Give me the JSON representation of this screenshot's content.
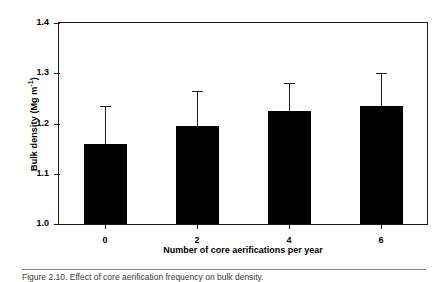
{
  "chart_data": {
    "type": "bar",
    "title": "",
    "categories": [
      "0",
      "2",
      "4",
      "6"
    ],
    "values": [
      1.16,
      1.195,
      1.225,
      1.235
    ],
    "errors": [
      0.075,
      0.07,
      0.055,
      0.065
    ],
    "series": [
      {
        "name": "Bulk density",
        "values": [
          1.16,
          1.195,
          1.225,
          1.235
        ],
        "errors": [
          0.075,
          0.07,
          0.055,
          0.065
        ]
      }
    ],
    "xlabel": "Number of core aerifications per year",
    "ylabel_text": "Bulk density (Mg m",
    "ylabel_sup": "-1",
    "ylabel_tail": ")",
    "ylabel_full": "Bulk density (Mg m-1)",
    "ylim": [
      1.0,
      1.4
    ],
    "yticks": [
      "1.0",
      "1.1",
      "1.2",
      "1.3",
      "1.4"
    ],
    "ytick_values": [
      1.0,
      1.1,
      1.2,
      1.3,
      1.4
    ],
    "xticks": [
      "0",
      "2",
      "4",
      "6"
    ],
    "grid": false,
    "legend": false,
    "bar_color": "#000000",
    "axis_color": "#1a1a1a",
    "error_bar_style": "upper-only-with-cap"
  },
  "caption": {
    "text": "Figure 2.10. Effect of core aerification frequency on bulk density."
  }
}
